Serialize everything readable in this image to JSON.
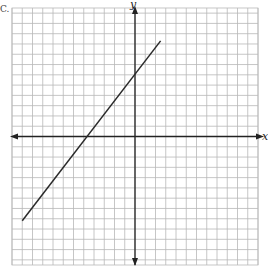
{
  "figure": {
    "corner_label": "C.",
    "axis_x_label": "x",
    "axis_y_label": "y"
  },
  "colors": {
    "grid": "#b8b8b8",
    "axis": "#222222",
    "line": "#2a2a2a",
    "background": "#ffffff"
  },
  "chart_data": {
    "type": "line",
    "title": "",
    "xlabel": "x",
    "ylabel": "y",
    "grid": true,
    "legend": null,
    "xlim": [
      -12,
      12
    ],
    "ylim": [
      -12.5,
      12.5
    ],
    "grid_spacing": 1,
    "tick_labels": "none",
    "series": [
      {
        "name": "line",
        "x": [
          -11,
          2.5
        ],
        "y": [
          -8.2,
          9.3
        ],
        "equation_estimate": "y ≈ (4/3)x + 6.3"
      }
    ],
    "x_intercept_estimate": -4.7,
    "y_intercept_estimate": 6.3
  }
}
